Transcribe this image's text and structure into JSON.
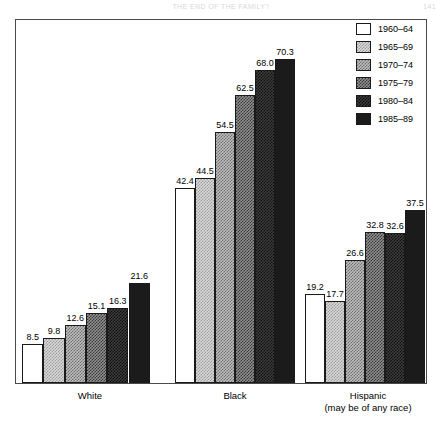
{
  "page": {
    "running_head": "THE END OF THE FAMILY?",
    "folio": "141"
  },
  "legend": {
    "items": [
      {
        "label": "1960–64",
        "swatch": "swatch-white"
      },
      {
        "label": "1965–69",
        "swatch": "swatch-light-dither"
      },
      {
        "label": "1970–74",
        "swatch": "swatch-medium-light-dither"
      },
      {
        "label": "1975–79",
        "swatch": "swatch-medium-dark-dither"
      },
      {
        "label": "1980–84",
        "swatch": "swatch-dark-dither"
      },
      {
        "label": "1985–89",
        "swatch": "swatch-black"
      }
    ]
  },
  "axis": {
    "categories": [
      {
        "label": "White",
        "sub": ""
      },
      {
        "label": "Black",
        "sub": ""
      },
      {
        "label": "Hispanic",
        "sub": "(may be of any race)"
      }
    ]
  },
  "chart_data": {
    "type": "bar",
    "title": "",
    "subtitle": "",
    "xlabel": "",
    "ylabel": "",
    "ylim": [
      0,
      75
    ],
    "grid": false,
    "legend_position": "top-right",
    "categories": [
      "White",
      "Black",
      "Hispanic (may be of any race)"
    ],
    "series": [
      {
        "name": "1960–64",
        "values": [
          8.5,
          42.4,
          19.2
        ]
      },
      {
        "name": "1965–69",
        "values": [
          9.8,
          44.5,
          17.7
        ]
      },
      {
        "name": "1970–74",
        "values": [
          12.6,
          54.5,
          26.6
        ]
      },
      {
        "name": "1975–79",
        "values": [
          15.1,
          62.5,
          32.8
        ]
      },
      {
        "name": "1980–84",
        "values": [
          16.3,
          68.0,
          32.6
        ]
      },
      {
        "name": "1985–89",
        "values": [
          21.6,
          70.3,
          37.5
        ]
      }
    ],
    "data_labels": {
      "White": [
        "8.5",
        "9.8",
        "12.6",
        "15.1",
        "16.3",
        "21.6"
      ],
      "Black": [
        "42.4",
        "44.5",
        "54.5",
        "62.5",
        "68.0",
        "70.3"
      ],
      "Hispanic": [
        "19.2",
        "17.7",
        "26.6",
        "32.8",
        "32.6",
        "37.5"
      ]
    }
  },
  "colors": {
    "frame": "#4a4a4a",
    "bar_outline": "#1a1a1a",
    "darkest_fill": "#1b1b1b",
    "lightest_fill": "#ffffff"
  }
}
